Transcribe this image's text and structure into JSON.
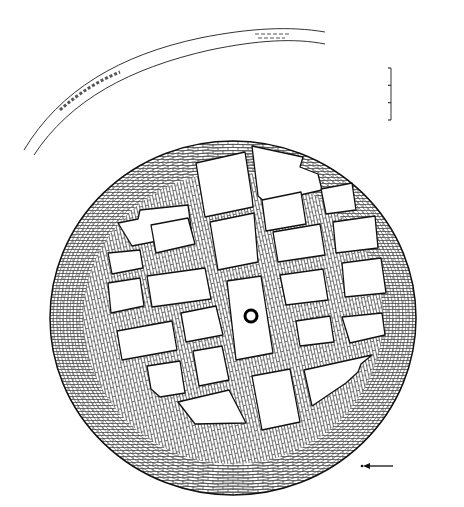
{
  "figure": {
    "type": "archaeological-plan",
    "background": "#ffffff",
    "ink": "#1a1a1a"
  },
  "platform": {
    "center": [
      233,
      318
    ],
    "radius": [
      183,
      177
    ],
    "grid_rotation_deg": -12,
    "cells": [
      {
        "id": 1,
        "pts": "196,163 245,152 252,197 253,207 205,217"
      },
      {
        "id": 2,
        "pts": "252,146 303,157 300,167 318,174 322,190 266,203 258,196"
      },
      {
        "id": 3,
        "pts": "118,223 138,219 140,210 188,205 192,235 163,240 132,246"
      },
      {
        "id": 4,
        "pts": "151,225 188,218 195,244 156,253"
      },
      {
        "id": 5,
        "pts": "210,222 254,213 258,262 218,270"
      },
      {
        "id": 6,
        "pts": "262,200 301,192 306,224 266,231"
      },
      {
        "id": 7,
        "pts": "321,189 352,183 356,210 326,214"
      },
      {
        "id": 8,
        "pts": "108,253 140,250 143,268 112,274"
      },
      {
        "id": 9,
        "pts": "273,232 320,224 325,255 278,262"
      },
      {
        "id": 10,
        "pts": "333,222 375,216 378,248 336,253"
      },
      {
        "id": 11,
        "pts": "108,283 140,278 144,306 111,313"
      },
      {
        "id": 12,
        "pts": "147,276 205,268 211,299 152,307"
      },
      {
        "id": 13,
        "pts": "227,281 261,276 273,353 236,360"
      },
      {
        "id": 14,
        "pts": "280,275 323,269 328,300 286,305"
      },
      {
        "id": 15,
        "pts": "342,263 381,258 386,293 345,297"
      },
      {
        "id": 16,
        "pts": "117,331 172,321 177,350 122,360"
      },
      {
        "id": 17,
        "pts": "181,313 216,306 223,335 186,342"
      },
      {
        "id": 18,
        "pts": "296,321 330,316 334,342 300,346"
      },
      {
        "id": 19,
        "pts": "342,317 382,313 385,335 350,343"
      },
      {
        "id": 20,
        "pts": "193,351 222,346 229,380 199,386"
      },
      {
        "id": 21,
        "pts": "147,366 180,361 185,393 160,397 151,389"
      },
      {
        "id": 22,
        "pts": "178,402 229,390 246,423 195,424"
      },
      {
        "id": 23,
        "pts": "252,376 290,369 300,422 262,430"
      },
      {
        "id": 24,
        "pts": "304,370 372,355 361,364 358,372 346,383 312,406"
      }
    ],
    "central_feature": {
      "shape": "ring",
      "cx": 251,
      "cy": 316,
      "r": 6
    }
  },
  "outer_wall_arc": {
    "outer_path": "M24,150 C60,90 120,55 200,38 C250,28 290,26 325,32",
    "inner_path": "M34,155 C70,100 130,68 210,50 C258,40 295,38 325,44"
  },
  "scale_bar": {
    "x": 391,
    "y_top": 68,
    "y_bottom": 120,
    "ticks": 4
  },
  "north_arrow": {
    "from": [
      393,
      466
    ],
    "to": [
      365,
      466
    ],
    "dot": [
      362,
      466
    ]
  }
}
